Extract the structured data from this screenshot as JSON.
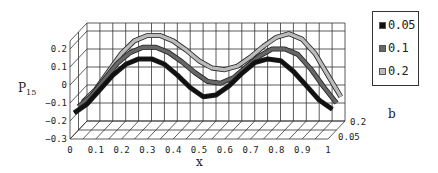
{
  "chart_data": {
    "type": "line",
    "style": "3d-ribbon",
    "title": "",
    "xlabel": "x",
    "ylabel": "P15",
    "ylabel_main": "P",
    "ylabel_sub": "15",
    "zlabel": "b",
    "xlim": [
      0,
      1
    ],
    "ylim": [
      -0.3,
      0.2
    ],
    "x_ticks": [
      "0",
      "0.1",
      "0.2",
      "0.3",
      "0.4",
      "0.5",
      "0.6",
      "0.7",
      "0.8",
      "0.9",
      "1"
    ],
    "y_ticks": [
      "0.2",
      "0.1",
      "0",
      "-0.1",
      "-0.2",
      "-0.3"
    ],
    "z_ticks": [
      "0.2",
      "0.05"
    ],
    "grid": true,
    "legend_position": "right",
    "x": [
      0,
      0.05,
      0.1,
      0.15,
      0.2,
      0.25,
      0.3,
      0.35,
      0.4,
      0.45,
      0.5,
      0.55,
      0.6,
      0.65,
      0.7,
      0.75,
      0.8,
      0.85,
      0.9,
      0.95,
      1
    ],
    "series": [
      {
        "name": "0.05",
        "color": "#111111",
        "values": [
          -0.18,
          -0.13,
          -0.05,
          0.03,
          0.09,
          0.12,
          0.12,
          0.09,
          0.03,
          -0.04,
          -0.09,
          -0.08,
          -0.03,
          0.04,
          0.1,
          0.12,
          0.11,
          0.05,
          -0.03,
          -0.11,
          -0.16
        ]
      },
      {
        "name": "0.1",
        "color": "#666666",
        "values": [
          -0.17,
          -0.11,
          -0.02,
          0.07,
          0.13,
          0.16,
          0.16,
          0.13,
          0.08,
          0.02,
          -0.03,
          -0.04,
          -0.01,
          0.05,
          0.11,
          0.15,
          0.15,
          0.12,
          0.04,
          -0.06,
          -0.15
        ]
      },
      {
        "name": "0.2",
        "color": "#bbbbbb",
        "values": [
          -0.17,
          -0.1,
          0.0,
          0.1,
          0.17,
          0.2,
          0.2,
          0.17,
          0.12,
          0.06,
          0.02,
          0.01,
          0.03,
          0.08,
          0.14,
          0.19,
          0.21,
          0.18,
          0.1,
          -0.02,
          -0.14
        ]
      }
    ]
  },
  "legend": {
    "items": [
      {
        "label": "0.05",
        "color": "#111111"
      },
      {
        "label": "0.1",
        "color": "#666666"
      },
      {
        "label": "0.2",
        "color": "#bbbbbb"
      }
    ]
  }
}
